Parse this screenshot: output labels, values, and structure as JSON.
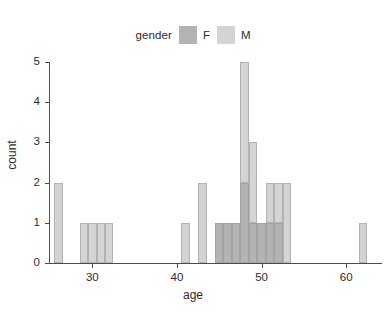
{
  "chart_data": {
    "type": "bar",
    "subtype": "stacked-histogram",
    "title": "",
    "xlabel": "age",
    "ylabel": "count",
    "xlim": [
      25,
      64
    ],
    "ylim": [
      0,
      5
    ],
    "xticks": [
      30,
      40,
      50,
      60
    ],
    "xtick_labels": [
      "30",
      "40",
      "50",
      "60"
    ],
    "yticks": [
      0,
      1,
      2,
      3,
      4,
      5
    ],
    "ytick_labels": [
      "0",
      "1",
      "2",
      "3",
      "4",
      "5"
    ],
    "grid": false,
    "legend": {
      "title": "gender",
      "position": "top",
      "entries": [
        {
          "label": "F",
          "color": "#b3b3b3"
        },
        {
          "label": "M",
          "color": "#d4d4d4"
        }
      ]
    },
    "binwidth": 1,
    "categories": [
      26,
      29,
      30,
      31,
      32,
      41,
      43,
      45,
      46,
      47,
      48,
      49,
      50,
      51,
      52,
      53,
      62
    ],
    "series": [
      {
        "name": "F",
        "color": "#b3b3b3",
        "values": [
          0,
          0,
          0,
          0,
          0,
          0,
          0,
          1,
          1,
          1,
          2,
          1,
          1,
          1,
          1,
          0,
          0
        ]
      },
      {
        "name": "M",
        "color": "#d4d4d4",
        "values": [
          2,
          1,
          1,
          1,
          1,
          1,
          2,
          0,
          0,
          0,
          3,
          2,
          0,
          1,
          1,
          2,
          1
        ]
      }
    ],
    "bars": [
      {
        "age": 26,
        "F": 0,
        "M": 2,
        "total": 2
      },
      {
        "age": 29,
        "F": 0,
        "M": 1,
        "total": 1
      },
      {
        "age": 30,
        "F": 0,
        "M": 1,
        "total": 1
      },
      {
        "age": 31,
        "F": 0,
        "M": 1,
        "total": 1
      },
      {
        "age": 32,
        "F": 0,
        "M": 1,
        "total": 1
      },
      {
        "age": 41,
        "F": 0,
        "M": 1,
        "total": 1
      },
      {
        "age": 43,
        "F": 0,
        "M": 2,
        "total": 2
      },
      {
        "age": 45,
        "F": 1,
        "M": 0,
        "total": 1
      },
      {
        "age": 46,
        "F": 1,
        "M": 0,
        "total": 1
      },
      {
        "age": 47,
        "F": 1,
        "M": 0,
        "total": 1
      },
      {
        "age": 48,
        "F": 2,
        "M": 3,
        "total": 5
      },
      {
        "age": 49,
        "F": 1,
        "M": 2,
        "total": 3
      },
      {
        "age": 50,
        "F": 1,
        "M": 0,
        "total": 1
      },
      {
        "age": 51,
        "F": 1,
        "M": 1,
        "total": 2
      },
      {
        "age": 52,
        "F": 1,
        "M": 1,
        "total": 2
      },
      {
        "age": 53,
        "F": 0,
        "M": 2,
        "total": 2
      },
      {
        "age": 62,
        "F": 0,
        "M": 1,
        "total": 1
      }
    ]
  }
}
